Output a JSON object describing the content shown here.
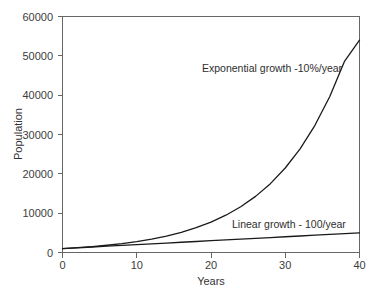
{
  "chart_data": {
    "type": "line",
    "title": "",
    "xlabel": "Years",
    "ylabel": "Population",
    "xlim": [
      0,
      40
    ],
    "ylim": [
      0,
      60000
    ],
    "grid": false,
    "legend_position": "inline-annotations",
    "background_color": "#ffffff",
    "line_color": "#1a1a1a",
    "axis_color": "#666666",
    "xticks": [
      0,
      10,
      20,
      30,
      40
    ],
    "xtick_labels": [
      "0",
      "10",
      "20",
      "30",
      "40"
    ],
    "yticks": [
      0,
      10000,
      20000,
      30000,
      40000,
      50000,
      60000
    ],
    "ytick_labels": [
      "0",
      "10000",
      "20000",
      "30000",
      "40000",
      "50000",
      "60000"
    ],
    "x": [
      0,
      2,
      4,
      6,
      8,
      10,
      12,
      14,
      16,
      18,
      20,
      22,
      24,
      26,
      28,
      30,
      32,
      34,
      36,
      38,
      40
    ],
    "series": [
      {
        "name": "Exponential growth -10%/year",
        "annotation": "Exponential growth -10%/year",
        "start_value": 1000,
        "rate_percent_per_year": 10,
        "end_value": 54000,
        "values": [
          1000,
          1227,
          1506,
          1847,
          2266,
          2780,
          3411,
          4185,
          5134,
          6299,
          7728,
          9481,
          11632,
          14271,
          17508,
          21480,
          26354,
          32334,
          39670,
          48670,
          54000
        ]
      },
      {
        "name": "Linear growth - 100/year",
        "annotation": "Linear growth - 100/year",
        "start_value": 1000,
        "rate_per_year": 100,
        "end_value": 5000,
        "values": [
          1000,
          1200,
          1400,
          1600,
          1800,
          2000,
          2200,
          2400,
          2600,
          2800,
          3000,
          3200,
          3400,
          3600,
          3800,
          4000,
          4200,
          4400,
          4600,
          4800,
          5000
        ]
      }
    ],
    "annotations": [
      {
        "text": "Exponential growth -10%/year",
        "x_px": 202,
        "y_px": 72
      },
      {
        "text": "Linear growth - 100/year",
        "x_px": 232,
        "y_px": 228
      }
    ]
  }
}
